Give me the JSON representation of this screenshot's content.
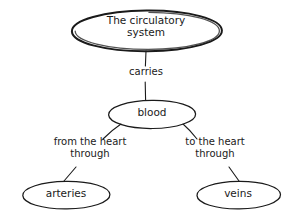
{
  "diagram": {
    "type": "concept-map",
    "background_color": "#ffffff",
    "stroke_color": "#1a1a1a",
    "text_color": "#1a1a1a",
    "nodes": [
      {
        "id": "root",
        "label": "The circulatory\nsystem",
        "shape": "ellipse",
        "emphasis": "bold"
      },
      {
        "id": "blood",
        "label": "blood",
        "shape": "ellipse",
        "emphasis": "normal"
      },
      {
        "id": "arteries",
        "label": "arteries",
        "shape": "ellipse",
        "emphasis": "normal"
      },
      {
        "id": "veins",
        "label": "veins",
        "shape": "ellipse",
        "emphasis": "normal"
      }
    ],
    "links": [
      {
        "id": "root-blood",
        "from": "root",
        "to": "blood",
        "label": "carries"
      },
      {
        "id": "blood-arteries",
        "from": "blood",
        "to": "arteries",
        "label": "from the heart\nthrough"
      },
      {
        "id": "blood-veins",
        "from": "blood",
        "to": "veins",
        "label": "to the heart\nthrough"
      }
    ]
  }
}
